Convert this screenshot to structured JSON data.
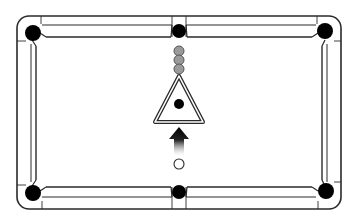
{
  "diagram": {
    "title": "Pool table rack setup",
    "colors": {
      "background": "#ffffff",
      "line": "#2a2a2a",
      "rail_inner": "#555555",
      "pocket": "#000000",
      "object_ball": "#9a9a9a",
      "object_ball_stroke": "#555555",
      "eight_ball": "#000000",
      "cue_ball": "#ffffff",
      "arrow": "#000000"
    },
    "table": {
      "outer": {
        "x": 17,
        "y": 16,
        "w": 324,
        "h": 193,
        "radius": 12
      },
      "rails": {
        "top_inner_y": 25,
        "top_cushion_y": 37,
        "bottom_cushion_y": 187,
        "bottom_inner_y": 197,
        "left_inner_x": 31,
        "left_cushion_x": 36,
        "right_cushion_x": 322,
        "right_inner_x": 327
      }
    },
    "pockets": [
      {
        "name": "top-left-pocket",
        "cx": 33,
        "cy": 33,
        "r": 8
      },
      {
        "name": "top-center-pocket",
        "cx": 179,
        "cy": 31,
        "r": 7
      },
      {
        "name": "top-right-pocket",
        "cx": 325,
        "cy": 31,
        "r": 8
      },
      {
        "name": "bottom-left-pocket",
        "cx": 33,
        "cy": 193,
        "r": 8
      },
      {
        "name": "bottom-center-pocket",
        "cx": 179,
        "cy": 192,
        "r": 7
      },
      {
        "name": "bottom-right-pocket",
        "cx": 326,
        "cy": 191,
        "r": 8
      }
    ],
    "object_balls": [
      {
        "cx": 179,
        "cy": 51,
        "r": 5
      },
      {
        "cx": 179,
        "cy": 60,
        "r": 5
      },
      {
        "cx": 179,
        "cy": 69,
        "r": 5
      }
    ],
    "rack_triangle": {
      "apex": [
        179,
        76
      ],
      "base_left": [
        155,
        122
      ],
      "base_right": [
        203,
        122
      ]
    },
    "eight_ball": {
      "cx": 179,
      "cy": 104,
      "r": 5
    },
    "arrow": {
      "tip_y": 127,
      "head_base_y": 139,
      "shaft_end_y": 156,
      "x": 179,
      "head_half_width": 10,
      "shaft_half_width": 5,
      "direction": "up"
    },
    "cue_ball": {
      "cx": 179,
      "cy": 164,
      "r": 5
    }
  }
}
